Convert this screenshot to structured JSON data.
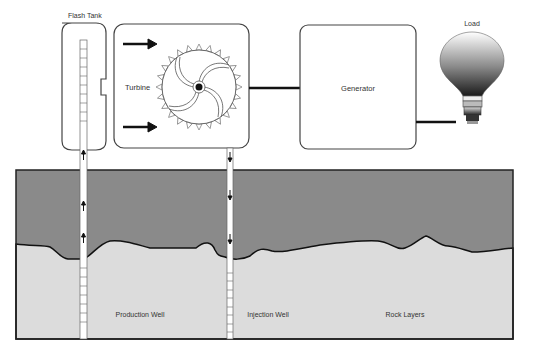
{
  "labels": {
    "flash_tank": "Flash Tank",
    "turbine": "Turbine",
    "generator": "Generator",
    "load": "Load",
    "production_well": "Production Well",
    "injection_well": "Injection Well",
    "rock_layers": "Rock Layers"
  },
  "colors": {
    "upper_layer": "#8a8a8a",
    "lower_layer": "#dcdcdc",
    "outline": "#222222",
    "box_stroke": "#555555",
    "background": "#ffffff"
  },
  "icons": {
    "turbine": "turbine-wheel-icon",
    "bulb": "light-bulb-icon",
    "flow_arrow": "arrow-icon"
  }
}
